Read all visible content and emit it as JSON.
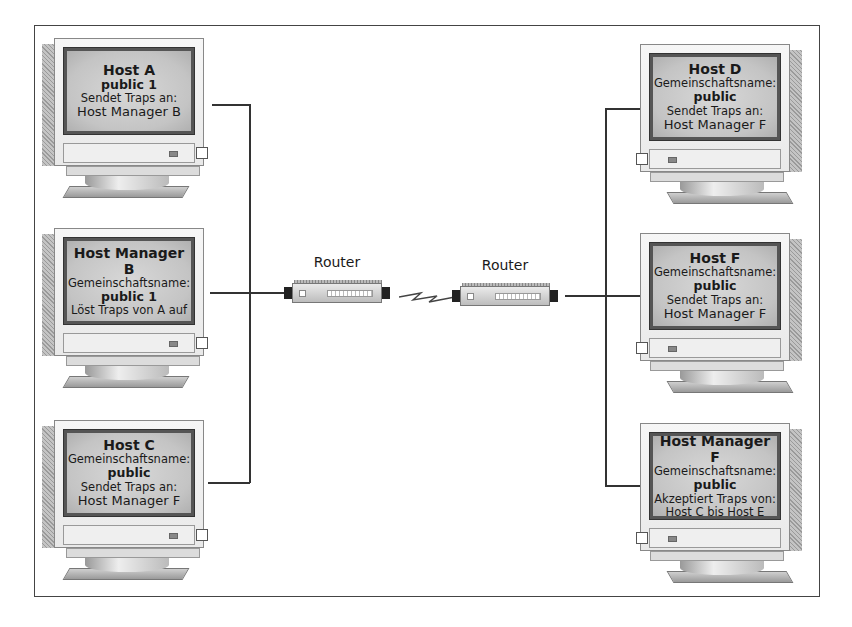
{
  "diagram": {
    "type": "network-topology",
    "left_segment": {
      "hosts": [
        {
          "id": "host-a",
          "title": "Host A",
          "lines": [
            {
              "text": "public 1",
              "style": "strong"
            },
            {
              "text": "Sendet Traps an:",
              "style": "norm"
            },
            {
              "text": "Host Manager B",
              "style": "big"
            }
          ]
        },
        {
          "id": "host-manager-b",
          "title": "Host Manager B",
          "lines": [
            {
              "text": "Gemeinschaftsname:",
              "style": "norm"
            },
            {
              "text": "public 1",
              "style": "strong"
            },
            {
              "text": "Löst Traps von A auf",
              "style": "norm"
            }
          ]
        },
        {
          "id": "host-c",
          "title": "Host C",
          "lines": [
            {
              "text": "Gemeinschaftsname:",
              "style": "norm"
            },
            {
              "text": "public",
              "style": "strong"
            },
            {
              "text": "Sendet Traps an:",
              "style": "norm"
            },
            {
              "text": "Host Manager F",
              "style": "big"
            }
          ]
        }
      ],
      "router_label": "Router"
    },
    "right_segment": {
      "hosts": [
        {
          "id": "host-d",
          "title": "Host D",
          "lines": [
            {
              "text": "Gemeinschaftsname:",
              "style": "norm"
            },
            {
              "text": "public",
              "style": "strong"
            },
            {
              "text": "Sendet Traps an:",
              "style": "norm"
            },
            {
              "text": "Host Manager F",
              "style": "big"
            }
          ]
        },
        {
          "id": "host-f",
          "title": "Host F",
          "lines": [
            {
              "text": "Gemeinschaftsname:",
              "style": "norm"
            },
            {
              "text": "public",
              "style": "strong"
            },
            {
              "text": "Sendet Traps an:",
              "style": "norm"
            },
            {
              "text": "Host Manager F",
              "style": "big"
            }
          ]
        },
        {
          "id": "host-manager-f",
          "title": "Host Manager F",
          "lines": [
            {
              "text": "Gemeinschaftsname:",
              "style": "norm"
            },
            {
              "text": "public",
              "style": "strong"
            },
            {
              "text": "Akzeptiert Traps von:",
              "style": "norm"
            },
            {
              "text": "Host C bis Host E",
              "style": "norm"
            }
          ]
        }
      ],
      "router_label": "Router"
    },
    "wan_link": "serial-lightning-bolt",
    "icons": [
      "monitor-icon",
      "router-icon",
      "lightning-bolt-icon"
    ]
  }
}
